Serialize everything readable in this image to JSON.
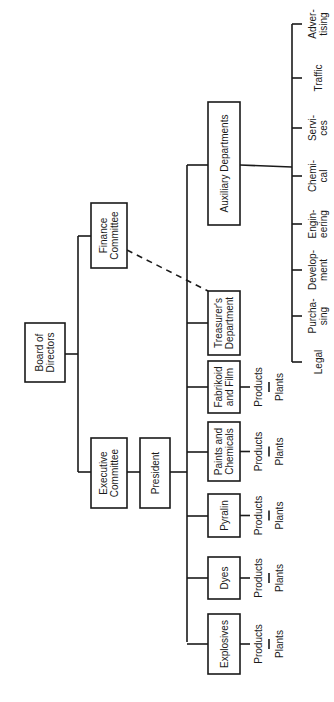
{
  "orientation": "rotated-90-ccw",
  "nodes": {
    "board": {
      "lines": [
        "Board of",
        "Directors"
      ]
    },
    "finance": {
      "lines": [
        "Finance",
        "Committee"
      ]
    },
    "executive": {
      "lines": [
        "Executive",
        "Committee"
      ]
    },
    "president": {
      "lines": [
        "President"
      ]
    },
    "auxiliary": {
      "lines": [
        "Auxiliary Departments"
      ]
    },
    "treasurer": {
      "lines": [
        "Treasurer's",
        "Department"
      ]
    },
    "fabrikoid": {
      "lines": [
        "Fabrikoid",
        "and Film"
      ]
    },
    "paints": {
      "lines": [
        "Paints and",
        "Chemicals"
      ]
    },
    "pyralin": {
      "lines": [
        "Pyralin"
      ]
    },
    "dyes": {
      "lines": [
        "Dyes"
      ]
    },
    "explosives": {
      "lines": [
        "Explosives"
      ]
    }
  },
  "product_chain": {
    "top": "Products",
    "bottom": "Plants"
  },
  "auxiliary_departments": [
    {
      "lines": [
        "Legal"
      ]
    },
    {
      "lines": [
        "Purcha-",
        "sing"
      ]
    },
    {
      "lines": [
        "Develop-",
        "ment"
      ]
    },
    {
      "lines": [
        "Engin-",
        "eering"
      ]
    },
    {
      "lines": [
        "Chemi-",
        "cal"
      ]
    },
    {
      "lines": [
        "Servi-",
        "ces"
      ]
    },
    {
      "lines": [
        "Traffic"
      ]
    },
    {
      "lines": [
        "Adver-",
        "tising"
      ]
    }
  ],
  "relationships": [
    {
      "from": "board",
      "to": "finance",
      "type": "solid"
    },
    {
      "from": "board",
      "to": "executive",
      "type": "solid"
    },
    {
      "from": "executive",
      "to": "president",
      "type": "solid"
    },
    {
      "from": "president",
      "to": "auxiliary",
      "type": "solid"
    },
    {
      "from": "president",
      "to": "treasurer",
      "type": "solid"
    },
    {
      "from": "president",
      "to": "fabrikoid",
      "type": "solid"
    },
    {
      "from": "president",
      "to": "paints",
      "type": "solid"
    },
    {
      "from": "president",
      "to": "pyralin",
      "type": "solid"
    },
    {
      "from": "president",
      "to": "dyes",
      "type": "solid"
    },
    {
      "from": "president",
      "to": "explosives",
      "type": "solid"
    },
    {
      "from": "finance",
      "to": "treasurer",
      "type": "dashed"
    }
  ]
}
